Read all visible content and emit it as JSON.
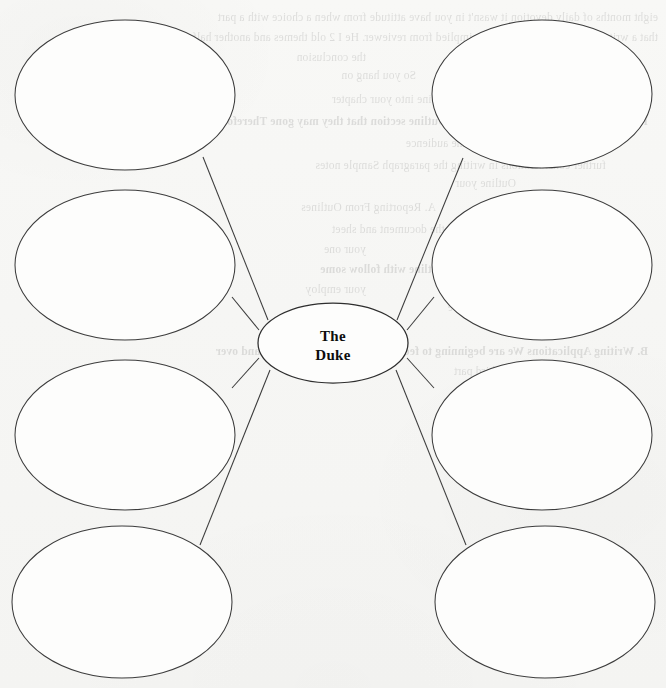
{
  "document": {
    "type": "graphic-organizer-worksheet",
    "organizer_style": "spider-web-map",
    "background_color": "#f7f7f5",
    "ink_color": "#3c3c3c",
    "text_color": "#0d0d0d"
  },
  "diagram": {
    "center": {
      "label_line_1": "The",
      "label_line_2": "Duke",
      "full_label": "The Duke",
      "cx": 333,
      "cy": 343,
      "rx": 75,
      "ry": 40
    },
    "branch_count": 8,
    "branches": [
      {
        "id": "branch-top-left",
        "label": "",
        "cx": 125,
        "cy": 95,
        "rx": 110,
        "ry": 75,
        "line_from": [
          268,
          320
        ],
        "line_to": [
          203,
          157
        ]
      },
      {
        "id": "branch-upper-left",
        "label": "",
        "cx": 125,
        "cy": 265,
        "rx": 110,
        "ry": 75,
        "line_from": [
          259,
          330
        ],
        "line_to": [
          232,
          297
        ]
      },
      {
        "id": "branch-lower-left",
        "label": "",
        "cx": 125,
        "cy": 435,
        "rx": 110,
        "ry": 75,
        "line_from": [
          259,
          358
        ],
        "line_to": [
          232,
          388
        ]
      },
      {
        "id": "branch-bottom-left",
        "label": "",
        "cx": 122,
        "cy": 602,
        "rx": 110,
        "ry": 76,
        "line_from": [
          270,
          370
        ],
        "line_to": [
          200,
          545
        ]
      },
      {
        "id": "branch-top-right",
        "label": "",
        "cx": 542,
        "cy": 94,
        "rx": 110,
        "ry": 74,
        "line_from": [
          397,
          320
        ],
        "line_to": [
          463,
          158
        ]
      },
      {
        "id": "branch-upper-right",
        "label": "",
        "cx": 542,
        "cy": 265,
        "rx": 110,
        "ry": 75,
        "line_from": [
          407,
          330
        ],
        "line_to": [
          434,
          297
        ]
      },
      {
        "id": "branch-lower-right",
        "label": "",
        "cx": 542,
        "cy": 435,
        "rx": 110,
        "ry": 75,
        "line_from": [
          407,
          358
        ],
        "line_to": [
          434,
          388
        ]
      },
      {
        "id": "branch-bottom-right",
        "label": "",
        "cx": 545,
        "cy": 602,
        "rx": 110,
        "ry": 76,
        "line_from": [
          396,
          370
        ],
        "line_to": [
          466,
          545
        ]
      }
    ]
  },
  "bleed_through": {
    "note": "faint mirrored text showing through from the reverse side of the page",
    "lines": [
      {
        "text": "eight months of daily devotion   it wasn't in   you have attitude  from   when a choice with a part",
        "x": 8,
        "y": 6,
        "strong": false
      },
      {
        "text": "that a writer's own personality may be implied from reviewer. He  I   2 old themes  and another half",
        "x": 8,
        "y": 26,
        "strong": false
      },
      {
        "text": "the conclusion",
        "x": 300,
        "y": 46,
        "strong": false
      },
      {
        "text": "So  you  hang on",
        "x": 250,
        "y": 64,
        "strong": false
      },
      {
        "text": "I  saw  Corresponding  a line  into  your   chapter",
        "x": 120,
        "y": 88,
        "strong": false
      },
      {
        "text": "I  would have every paragraph of every Outline section that they may gone  Therefore",
        "x": 18,
        "y": 110,
        "strong": true
      },
      {
        "text": "the  audience",
        "x": 200,
        "y": 132,
        "strong": false
      },
      {
        "text": "further  considerations in writing the paragraph  Sample notes",
        "x": 60,
        "y": 154,
        "strong": false
      },
      {
        "text": "Outline  your",
        "x": 150,
        "y": 172,
        "strong": false
      },
      {
        "text": "A.  Reporting  From  Outlines",
        "x": 230,
        "y": 196,
        "strong": false
      },
      {
        "text": "with  DOE  In  AS.,  of   the document  and  sheet",
        "x": 120,
        "y": 218,
        "strong": false
      },
      {
        "text": "your  one",
        "x": 300,
        "y": 238,
        "strong": false
      },
      {
        "text": "1.  Different  Reports  Reporting  the   Outline   with   follow  some",
        "x": 40,
        "y": 258,
        "strong": true
      },
      {
        "text": "your  employ",
        "x": 300,
        "y": 278,
        "strong": false
      },
      {
        "text": "2.  How is  the  source",
        "x": 120,
        "y": 296,
        "strong": false
      },
      {
        "text": "B.  Writing  Applications  We  are  beginning  to  feel  all  the  ways  requires  work  and  over",
        "x": 18,
        "y": 340,
        "strong": true
      },
      {
        "text": "the  third  part",
        "x": 150,
        "y": 360,
        "strong": false
      }
    ]
  }
}
